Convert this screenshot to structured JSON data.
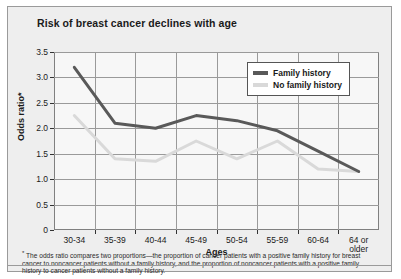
{
  "figure": {
    "title": "Risk of breast cancer declines with age",
    "footnote_marker": "*",
    "footnote": "The odds ratio compares two proportions—the proportion of cancer patients with a positive family history for breast cancer to noncancer patients without a family history, and the proportion of noncancer patients with a positive family history to cancer patients without a family history."
  },
  "legend": {
    "position": "top-right",
    "entries": [
      {
        "label": "Family history",
        "color": "#595959"
      },
      {
        "label": "No family history",
        "color": "#d9d9d9"
      }
    ]
  },
  "chart_data": {
    "type": "line",
    "title": "Risk of breast cancer declines with age",
    "xlabel": "Ages",
    "ylabel": "Odds ratio*",
    "categories": [
      "30-34",
      "35-39",
      "40-44",
      "45-49",
      "50-54",
      "55-59",
      "60-64",
      "64 or\nolder"
    ],
    "ytick_labels": [
      "0",
      "0.5",
      "1.0",
      "1.5",
      "2.0",
      "2.5",
      "3.0",
      "3.5"
    ],
    "ytick_values": [
      0,
      0.5,
      1.0,
      1.5,
      2.0,
      2.5,
      3.0,
      3.5
    ],
    "ylim": [
      0,
      3.5
    ],
    "grid": true,
    "series": [
      {
        "name": "Family history",
        "color": "#595959",
        "values": [
          3.2,
          2.1,
          2.0,
          2.25,
          2.15,
          1.95,
          1.55,
          1.15
        ]
      },
      {
        "name": "No family history",
        "color": "#d9d9d9",
        "values": [
          2.25,
          1.4,
          1.35,
          1.75,
          1.4,
          1.75,
          1.2,
          1.15
        ]
      }
    ]
  }
}
